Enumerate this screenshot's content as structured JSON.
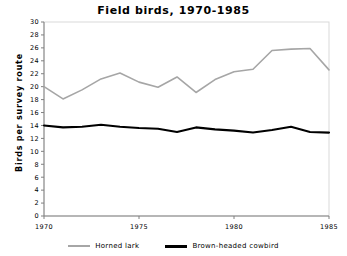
{
  "chart_data": {
    "type": "line",
    "title": "Field birds, 1970-1985",
    "xlabel": "",
    "ylabel": "Birds per survey route",
    "xlim": [
      1970,
      1985
    ],
    "ylim": [
      0,
      30
    ],
    "ytick_step": 2,
    "yticks": [
      0,
      2,
      4,
      6,
      8,
      10,
      12,
      14,
      16,
      18,
      20,
      22,
      24,
      26,
      28,
      30
    ],
    "ytick_labels": [
      "0",
      "2",
      "4",
      "6",
      "8",
      "10",
      "12",
      "14",
      "16",
      "18",
      "20",
      "22",
      "24",
      "26",
      "28",
      "30"
    ],
    "xticks": [
      1970,
      1975,
      1980,
      1985
    ],
    "xtick_labels": [
      "1970",
      "1975",
      "1980",
      "1985"
    ],
    "grid": false,
    "legend_position": "bottom",
    "x": [
      1970,
      1971,
      1972,
      1973,
      1974,
      1975,
      1976,
      1977,
      1978,
      1979,
      1980,
      1981,
      1982,
      1983,
      1984,
      1985
    ],
    "series": [
      {
        "name": "Horned lark",
        "color": "#a6a6a6",
        "values": [
          20.0,
          18.1,
          19.5,
          21.2,
          22.1,
          20.7,
          19.9,
          21.5,
          19.1,
          21.1,
          22.3,
          22.7,
          25.6,
          25.8,
          25.9,
          22.6
        ]
      },
      {
        "name": "Brown-headed cowbird",
        "color": "#000000",
        "values": [
          14.0,
          13.7,
          13.8,
          14.1,
          13.8,
          13.6,
          13.5,
          13.0,
          13.7,
          13.4,
          13.2,
          12.9,
          13.3,
          13.8,
          13.0,
          12.9
        ]
      }
    ]
  },
  "legend": {
    "entries": [
      {
        "label": "Horned lark"
      },
      {
        "label": "Brown-headed cowbird"
      }
    ]
  }
}
